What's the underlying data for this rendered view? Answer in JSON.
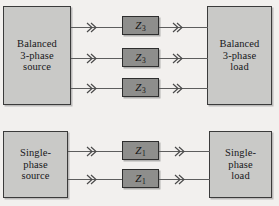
{
  "diagram": {
    "background_color": "#f2f0ee",
    "box_fill_color": "#c9c9c7",
    "impedance_fill_color": "#8e8e8c",
    "border_color": "#3b3b3b",
    "wire_color": "#5d5d5d",
    "arrow_icon": "double-chevron-right-icon"
  },
  "groups": [
    {
      "id": "three-phase",
      "source": {
        "label": "Balanced\n3-phase\nsource"
      },
      "load": {
        "label": "Balanced\n3-phase\nload"
      },
      "lines": [
        {
          "impedance": "Z",
          "subscript": "3"
        },
        {
          "impedance": "Z",
          "subscript": "3"
        },
        {
          "impedance": "Z",
          "subscript": "3"
        }
      ]
    },
    {
      "id": "single-phase",
      "source": {
        "label": "Single-\nphase\nsource"
      },
      "load": {
        "label": "Single-\nphase\nload"
      },
      "lines": [
        {
          "impedance": "Z",
          "subscript": "1"
        },
        {
          "impedance": "Z",
          "subscript": "1"
        }
      ]
    }
  ]
}
